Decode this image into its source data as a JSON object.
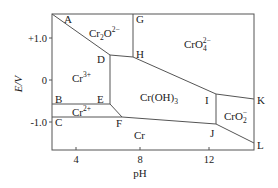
{
  "diagram": {
    "type": "pourbaix",
    "title": "",
    "xlabel": "pH",
    "ylabel": "E/V",
    "x_ticks": [
      "4",
      "8",
      "12"
    ],
    "y_ticks": [
      "+1.0",
      "0",
      "-1.0"
    ],
    "point_labels": [
      "A",
      "B",
      "C",
      "D",
      "E",
      "F",
      "G",
      "H",
      "I",
      "J",
      "K",
      "L"
    ],
    "regions": {
      "dichromate": {
        "base": "Cr",
        "sub1": "2",
        "mid": "O",
        "sub2": "7",
        "sup": "2−"
      },
      "chromate": {
        "base": "CrO",
        "sub": "4",
        "sup": "2−"
      },
      "cr3": {
        "base": "Cr",
        "sup": "3+"
      },
      "cr2": {
        "base": "Cr",
        "sup": "2+"
      },
      "hydroxide": {
        "base": "Cr(OH)",
        "sub": "3"
      },
      "chromite": {
        "base": "CrO",
        "sub": "2",
        "sup": "−"
      },
      "metal": {
        "base": "Cr"
      }
    },
    "line_color": "#555555"
  }
}
